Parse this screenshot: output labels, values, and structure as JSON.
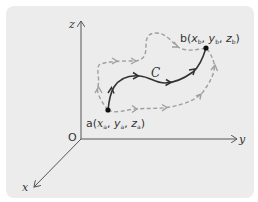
{
  "diagram": {
    "type": "3d-coordinate-path-diagram",
    "axes": {
      "origin_label": "O",
      "x_label": "x",
      "y_label": "y",
      "z_label": "z"
    },
    "points": {
      "a": {
        "name": "a",
        "coords": [
          "x",
          "y",
          "z"
        ],
        "subscript": "a",
        "label": "a(xa, ya, za)"
      },
      "b": {
        "name": "b",
        "coords": [
          "x",
          "y",
          "z"
        ],
        "subscript": "b",
        "label": "b(xb, yb, zb)"
      }
    },
    "curve": {
      "label": "C",
      "style": "solid",
      "color": "#333333"
    },
    "alternate_paths": [
      {
        "name": "upper-path",
        "style": "dashed",
        "color": "#a0a0a0"
      },
      {
        "name": "lower-path",
        "style": "dashed",
        "color": "#a0a0a0"
      }
    ],
    "colors": {
      "background": "#ececec",
      "axis": "#555555",
      "curve": "#333333",
      "dashed": "#a0a0a0",
      "point": "#111111"
    }
  }
}
